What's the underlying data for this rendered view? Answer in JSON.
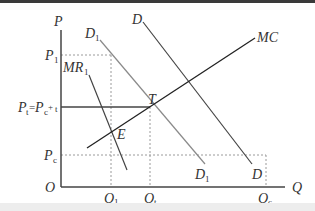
{
  "diagram": {
    "title": "",
    "axes": {
      "y_label": "P",
      "x_label": "Q",
      "origin_label": "O"
    },
    "price_levels": [
      {
        "id": "P1",
        "base": "P",
        "sub": "1"
      },
      {
        "id": "Pt",
        "base": "P",
        "sub": "t",
        "full": "Pt=Pc+t"
      },
      {
        "id": "Pc",
        "base": "P",
        "sub": "c"
      }
    ],
    "quantity_levels": [
      {
        "id": "Q1",
        "base": "Q",
        "sub": "1"
      },
      {
        "id": "Qt",
        "base": "Q",
        "sub": "t"
      },
      {
        "id": "Qc",
        "base": "Q",
        "sub": "c"
      }
    ],
    "curves": [
      {
        "id": "D",
        "label_top": "D",
        "label_bottom": "D",
        "color": "#444444"
      },
      {
        "id": "D1",
        "label_top": "D1",
        "label_bottom": "D1",
        "color": "#8a8a8a"
      },
      {
        "id": "MR1",
        "label": "MR1",
        "color": "#444444"
      },
      {
        "id": "MC",
        "label": "MC",
        "color": "#222222"
      }
    ],
    "points": [
      {
        "id": "T",
        "label": "T"
      },
      {
        "id": "E",
        "label": "E"
      }
    ],
    "labels": {
      "P": "P",
      "Q": "Q",
      "O": "O",
      "P1_base": "P",
      "P1_sub": "1",
      "Pt_base": "P",
      "Pt_sub": "t",
      "Pt_eq": "=",
      "Pc_inner_base": "P",
      "Pc_inner_sub": "c",
      "plus": "+",
      "t_sub": "t",
      "Pc_base": "P",
      "Pc_sub": "c",
      "Q1_base": "Q",
      "Q1_sub": "1",
      "Qt_base": "Q",
      "Qt_sub": "t",
      "Qc_base": "Q",
      "Qc_sub": "c",
      "D_top": "D",
      "D_bottom": "D",
      "D1_top_base": "D",
      "D1_top_sub": "1",
      "D1_bottom_base": "D",
      "D1_bottom_sub": "1",
      "MR1_base": "MR",
      "MR1_sub": "1",
      "MC": "MC",
      "T": "T",
      "E": "E"
    }
  }
}
